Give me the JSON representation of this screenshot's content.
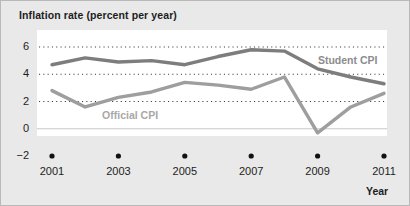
{
  "chart_data": {
    "type": "line",
    "title": "Inflation rate (percent per year)",
    "xlabel": "Year",
    "ylabel": "",
    "xlim": [
      2001,
      2011
    ],
    "ylim": [
      -2,
      6.8
    ],
    "grid": "horizontal-dotted",
    "legend_position": "inline-annotation",
    "x": [
      2001,
      2002,
      2003,
      2004,
      2005,
      2006,
      2007,
      2008,
      2009,
      2010,
      2011
    ],
    "xticks": [
      "2001",
      "2003",
      "2005",
      "2007",
      "2009",
      "2011"
    ],
    "xtick_values": [
      2001,
      2003,
      2005,
      2007,
      2009,
      2011
    ],
    "yticks": [
      "6",
      "4",
      "2",
      "0",
      "−2"
    ],
    "ytick_values": [
      6,
      4,
      2,
      0,
      -2
    ],
    "series": [
      {
        "name": "Student CPI",
        "color": "#7d7d7d",
        "values": [
          4.7,
          5.2,
          4.9,
          5.0,
          4.7,
          5.3,
          5.8,
          5.7,
          4.4,
          3.8,
          3.3
        ]
      },
      {
        "name": "Official CPI",
        "color": "#9e9e9e",
        "values": [
          2.8,
          1.6,
          2.3,
          2.7,
          3.4,
          3.2,
          2.9,
          3.8,
          -0.3,
          1.6,
          2.6
        ]
      }
    ],
    "annotations": [
      {
        "text": "Student CPI",
        "x": 2009.1,
        "y": 5.0
      },
      {
        "text": "Official CPI",
        "x": 2002.6,
        "y": 0.95
      }
    ]
  },
  "colors": {
    "figure_background": "#e9e9e9",
    "plot_background": "#ffffff",
    "text": "#1d1d1d",
    "gridline": "#3a3a3a",
    "zero_line": "#c8c8c8",
    "student_cpi": "#7d7d7d",
    "official_cpi": "#9e9e9e",
    "tick_dot": "#111111"
  }
}
